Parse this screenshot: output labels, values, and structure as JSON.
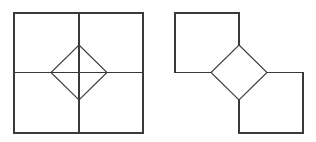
{
  "canvas": {
    "width": 316,
    "height": 142,
    "background": "#ffffff",
    "stroke_color": "#3a3a3a",
    "stroke_width": 1.1
  },
  "figures": [
    {
      "id": "left-figure",
      "name": "square-with-inscribed-diamond",
      "description": "A large square subdivided by a horizontal and a vertical midline into four equal quadrants, with a diamond (square rotated 45 degrees) inscribed at the center whose four vertices touch the midpoints of the outer square's sides",
      "outer_square": {
        "x": 14,
        "y": 13,
        "width": 129,
        "height": 120
      },
      "midlines": {
        "vertical_x": 79,
        "horizontal_y": 72.5
      },
      "diamond": {
        "center_x": 79,
        "center_y": 72.5,
        "half_width": 28,
        "half_height": 27.5,
        "vertices": [
          [
            79,
            45
          ],
          [
            107,
            72.5
          ],
          [
            79,
            100
          ],
          [
            51,
            72.5
          ]
        ]
      }
    },
    {
      "id": "right-figure",
      "name": "two-corner-squares-with-diamond",
      "description": "A central diamond with two squares attached at opposite corners: one square above-left touching the diamond's top-left edge region, one square below-right touching the diamond's bottom-right edge region",
      "diamond": {
        "center_x": 239,
        "center_y": 72.5,
        "half_width": 28,
        "half_height": 27.5,
        "vertices": [
          [
            239,
            45
          ],
          [
            267,
            72.5
          ],
          [
            239,
            100
          ],
          [
            211,
            72.5
          ]
        ]
      },
      "top_left_square": {
        "x": 175,
        "y": 13,
        "width": 64,
        "height": 59.5
      },
      "bottom_right_square": {
        "x": 239,
        "y": 72.5,
        "width": 64,
        "height": 60.5
      }
    }
  ]
}
